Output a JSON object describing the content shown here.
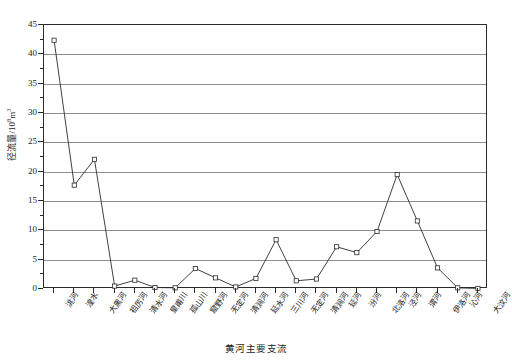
{
  "chart_data": {
    "type": "line",
    "title": "",
    "xlabel": "黄河主要支流",
    "ylabel": "径流量/10⁸m³",
    "ylabel_main": "径流量/10",
    "ylabel_exp": "8",
    "ylabel_unit": "m",
    "ylabel_unit_exp": "3",
    "ylim": [
      0,
      45
    ],
    "yticks": [
      0,
      5,
      10,
      15,
      20,
      25,
      30,
      35,
      40,
      45
    ],
    "ytick_labels": [
      "0",
      "5",
      "10",
      "15",
      "20",
      "25",
      "30",
      "35",
      "40",
      "45"
    ],
    "grid": true,
    "grid_axis": "y",
    "legend": "none",
    "marker": "open-square",
    "line_color": "#2b2b2b",
    "grid_color": "#8d8d8d",
    "categories": [
      "洮河",
      "湟水",
      "大黑河",
      "祖厉河",
      "清水河",
      "皇甫川",
      "孤山川",
      "窟野河",
      "无定河",
      "清涧河",
      "延水河",
      "三川河",
      "无定河",
      "清涧河",
      "延河",
      "汾河",
      "北洛河",
      "泾河",
      "渭河",
      "伊洛河",
      "沁河",
      "大汶河"
    ],
    "values": [
      42.4,
      17.7,
      22.1,
      0.5,
      1.5,
      0.25,
      0.2,
      3.5,
      1.9,
      0.35,
      1.8,
      8.4,
      1.4,
      1.7,
      7.2,
      6.2,
      9.8,
      19.5,
      11.6,
      3.6,
      0.2,
      0.1
    ],
    "point_count": 22,
    "y_max_value": 42.4,
    "y_min_value": 0.1
  }
}
